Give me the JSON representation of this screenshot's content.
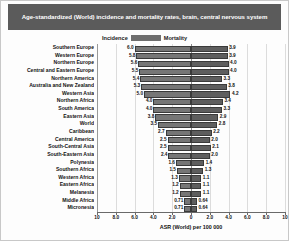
{
  "title": "Age-standardized (World) incidence and mortality rates, brain, central nervous system",
  "legend": {
    "incidence_label": "Incidence",
    "mortality_label": "Mortality",
    "incidence_color": "#767676",
    "mortality_color": "#5e5e5e"
  },
  "axis": {
    "title": "ASR (World) per 100 000",
    "tick_labels": [
      "10",
      "8.0",
      "6.0",
      "4.0",
      "2.0",
      "0",
      "2.0",
      "4.0",
      "6.0",
      "8.0",
      "10"
    ],
    "tick_values": [
      -10,
      -8,
      -6,
      -4,
      -2,
      0,
      2,
      4,
      6,
      8,
      10
    ]
  },
  "chart_data": {
    "type": "bar",
    "orientation": "horizontal-diverging",
    "title": "Age-standardized (World) incidence and mortality rates, brain, central nervous system",
    "xlabel": "ASR (World) per 100 000",
    "ylabel": "",
    "xlim": [
      -10,
      10
    ],
    "grid": true,
    "legend_position": "top-center",
    "categories": [
      "Southern Europe",
      "Western  Europe",
      "Northern Europe",
      "Central and Eastern Europe",
      "Northern America",
      "Australia and New Zealand",
      "Western Asia",
      "Northern Africa",
      "South America",
      "Eastern Asia",
      "World",
      "Caribbean",
      "Central America",
      "South-Central Asia",
      "South-Eastern Asia",
      "Polynesia",
      "Southern Africa",
      "Western Africa",
      "Eastern Africa",
      "Melanesia",
      "Middle Africa",
      "Micronesia"
    ],
    "series": [
      {
        "name": "Incidence",
        "values": [
          6.0,
          5.8,
          5.6,
          5.5,
          5.4,
          5.3,
          5.0,
          4.0,
          4.0,
          3.8,
          3.5,
          2.7,
          2.5,
          2.5,
          2.4,
          1.6,
          1.5,
          1.3,
          1.2,
          1.2,
          0.71,
          0.71
        ],
        "labels": [
          "6.0",
          "5.8",
          "5.6",
          "5.5",
          "5.4",
          "5.3",
          "5.0",
          "4.0",
          "4.0",
          "3.8",
          "3.5",
          "2.7",
          "2.5",
          "2.5",
          "2.4",
          "1.6",
          "1.5",
          "1.3",
          "1.2",
          "1.2",
          "0.71",
          "0.71"
        ]
      },
      {
        "name": "Mortality",
        "values": [
          3.9,
          3.9,
          4.0,
          4.0,
          3.3,
          3.8,
          4.2,
          3.4,
          3.3,
          2.9,
          2.8,
          2.2,
          2.0,
          2.1,
          2.0,
          1.4,
          1.3,
          1.1,
          1.1,
          1.1,
          0.64,
          0.64
        ],
        "labels": [
          "3.9",
          "3.9",
          "4.0",
          "4.0",
          "3.3",
          "3.8",
          "4.2",
          "3.4",
          "3.3",
          "2.9",
          "2.8",
          "2.2",
          "2.0",
          "2.1",
          "2.0",
          "1.4",
          "1.3",
          "1.1",
          "1.1",
          "1.1",
          "0.64",
          "0.64"
        ]
      }
    ]
  }
}
